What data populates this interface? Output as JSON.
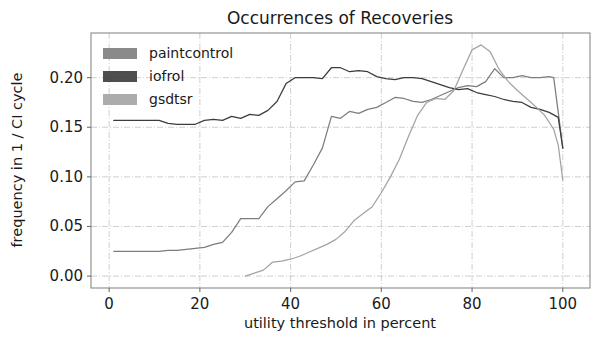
{
  "chart_data": {
    "type": "line",
    "title": "Occurrences of Recoveries",
    "xlabel": "utility threshold in percent",
    "ylabel": "frequency in 1 / CI cycle",
    "xlim": [
      -4,
      106
    ],
    "ylim": [
      -0.012,
      0.245
    ],
    "xticks": [
      0,
      20,
      40,
      60,
      80,
      100
    ],
    "xtick_labels": [
      "0",
      "20",
      "40",
      "60",
      "80",
      "100"
    ],
    "yticks": [
      0.0,
      0.05,
      0.1,
      0.15,
      0.2
    ],
    "ytick_labels": [
      "0.00",
      "0.05",
      "0.10",
      "0.15",
      "0.20"
    ],
    "grid": true,
    "grid_style": "dashdot",
    "legend_position": "upper left",
    "series": [
      {
        "name": "paintcontrol",
        "color": "#7d7d7d",
        "x": [
          1,
          3,
          5,
          7,
          9,
          11,
          13,
          15,
          17,
          19,
          21,
          23,
          25,
          27,
          29,
          31,
          33,
          35,
          37,
          39,
          41,
          43,
          45,
          47,
          49,
          51,
          53,
          55,
          57,
          59,
          61,
          63,
          65,
          67,
          69,
          71,
          73,
          75,
          77,
          79,
          81,
          83,
          85,
          87,
          89,
          91,
          93,
          95,
          97,
          98,
          99,
          100
        ],
        "values": [
          0.025,
          0.025,
          0.025,
          0.025,
          0.025,
          0.025,
          0.026,
          0.026,
          0.027,
          0.028,
          0.029,
          0.032,
          0.034,
          0.044,
          0.058,
          0.058,
          0.058,
          0.07,
          0.078,
          0.086,
          0.095,
          0.096,
          0.112,
          0.129,
          0.161,
          0.159,
          0.166,
          0.164,
          0.168,
          0.17,
          0.175,
          0.18,
          0.179,
          0.176,
          0.175,
          0.178,
          0.182,
          0.186,
          0.19,
          0.192,
          0.191,
          0.196,
          0.209,
          0.2,
          0.2,
          0.202,
          0.2,
          0.2,
          0.201,
          0.2,
          0.165,
          0.129
        ]
      },
      {
        "name": "iofrol",
        "color": "#3c3c3c",
        "x": [
          1,
          3,
          5,
          7,
          9,
          11,
          13,
          15,
          17,
          19,
          21,
          23,
          25,
          27,
          29,
          31,
          33,
          35,
          37,
          39,
          41,
          43,
          45,
          47,
          49,
          51,
          53,
          55,
          57,
          59,
          61,
          63,
          65,
          67,
          69,
          71,
          73,
          75,
          77,
          79,
          81,
          83,
          85,
          87,
          89,
          91,
          93,
          95,
          97,
          99,
          100
        ],
        "values": [
          0.157,
          0.157,
          0.157,
          0.157,
          0.157,
          0.157,
          0.154,
          0.153,
          0.153,
          0.153,
          0.157,
          0.158,
          0.157,
          0.161,
          0.159,
          0.163,
          0.162,
          0.167,
          0.176,
          0.194,
          0.2,
          0.2,
          0.2,
          0.199,
          0.21,
          0.21,
          0.206,
          0.207,
          0.206,
          0.201,
          0.199,
          0.198,
          0.2,
          0.2,
          0.199,
          0.196,
          0.193,
          0.19,
          0.188,
          0.189,
          0.185,
          0.183,
          0.181,
          0.178,
          0.176,
          0.175,
          0.17,
          0.168,
          0.165,
          0.16,
          0.129
        ]
      },
      {
        "name": "gsdtsr",
        "color": "#a3a3a3",
        "x": [
          30,
          32,
          34,
          36,
          38,
          40,
          42,
          44,
          46,
          48,
          50,
          52,
          54,
          56,
          58,
          60,
          62,
          64,
          66,
          68,
          70,
          72,
          74,
          76,
          78,
          80,
          82,
          84,
          86,
          88,
          90,
          92,
          94,
          96,
          98,
          99,
          100
        ],
        "values": [
          0.0,
          0.003,
          0.006,
          0.014,
          0.015,
          0.017,
          0.02,
          0.024,
          0.028,
          0.032,
          0.037,
          0.045,
          0.056,
          0.063,
          0.07,
          0.084,
          0.1,
          0.118,
          0.141,
          0.162,
          0.175,
          0.179,
          0.178,
          0.187,
          0.208,
          0.228,
          0.233,
          0.226,
          0.208,
          0.196,
          0.187,
          0.179,
          0.171,
          0.162,
          0.148,
          0.132,
          0.097
        ]
      }
    ]
  },
  "legend": {
    "items": [
      {
        "label": "paintcontrol",
        "swatch": "#7d7d7d"
      },
      {
        "label": "iofrol",
        "swatch": "#3c3c3c"
      },
      {
        "label": "gsdtsr",
        "swatch": "#a3a3a3"
      }
    ]
  }
}
